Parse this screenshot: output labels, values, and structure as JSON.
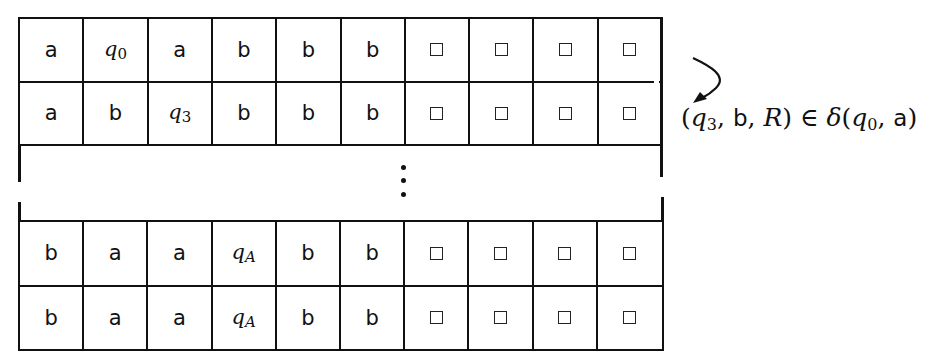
{
  "diagram": {
    "top_rows": [
      {
        "cells": [
          {
            "type": "symbol",
            "value": "a"
          },
          {
            "type": "state",
            "base": "q",
            "sub": "0",
            "sub_italic": false
          },
          {
            "type": "symbol",
            "value": "a"
          },
          {
            "type": "symbol",
            "value": "b"
          },
          {
            "type": "symbol",
            "value": "b"
          },
          {
            "type": "symbol",
            "value": "b"
          },
          {
            "type": "blank",
            "value": "□"
          },
          {
            "type": "blank",
            "value": "□"
          },
          {
            "type": "blank",
            "value": "□"
          },
          {
            "type": "blank",
            "value": "□"
          }
        ]
      },
      {
        "cells": [
          {
            "type": "symbol",
            "value": "a"
          },
          {
            "type": "symbol",
            "value": "b"
          },
          {
            "type": "state",
            "base": "q",
            "sub": "3",
            "sub_italic": false
          },
          {
            "type": "symbol",
            "value": "b"
          },
          {
            "type": "symbol",
            "value": "b"
          },
          {
            "type": "symbol",
            "value": "b"
          },
          {
            "type": "blank",
            "value": "□"
          },
          {
            "type": "blank",
            "value": "□"
          },
          {
            "type": "blank",
            "value": "□"
          },
          {
            "type": "blank",
            "value": "□"
          }
        ]
      }
    ],
    "ellipsis": "⋮",
    "bottom_rows": [
      {
        "cells": [
          {
            "type": "symbol",
            "value": "b"
          },
          {
            "type": "symbol",
            "value": "a"
          },
          {
            "type": "symbol",
            "value": "a"
          },
          {
            "type": "state",
            "base": "q",
            "sub": "A",
            "sub_italic": true
          },
          {
            "type": "symbol",
            "value": "b"
          },
          {
            "type": "symbol",
            "value": "b"
          },
          {
            "type": "blank",
            "value": "□"
          },
          {
            "type": "blank",
            "value": "□"
          },
          {
            "type": "blank",
            "value": "□"
          },
          {
            "type": "blank",
            "value": "□"
          }
        ]
      },
      {
        "cells": [
          {
            "type": "symbol",
            "value": "b"
          },
          {
            "type": "symbol",
            "value": "a"
          },
          {
            "type": "symbol",
            "value": "a"
          },
          {
            "type": "state",
            "base": "q",
            "sub": "A",
            "sub_italic": true
          },
          {
            "type": "symbol",
            "value": "b"
          },
          {
            "type": "symbol",
            "value": "b"
          },
          {
            "type": "blank",
            "value": "□"
          },
          {
            "type": "blank",
            "value": "□"
          },
          {
            "type": "blank",
            "value": "□"
          },
          {
            "type": "blank",
            "value": "□"
          }
        ]
      }
    ],
    "annotation": {
      "open": "(",
      "q": "q",
      "q_sub": "3",
      "comma1": ", ",
      "write": "b",
      "comma2": ", ",
      "move": "R",
      "close_in": ") ∈ ",
      "delta": "δ",
      "open2": "(",
      "q2": "q",
      "q2_sub": "0",
      "comma3": ", ",
      "read": "a",
      "close2": ")"
    },
    "arrow": {
      "icon": "curved-arrow-icon",
      "color": "#111111"
    },
    "line_color": "#111111",
    "background": "#ffffff"
  }
}
